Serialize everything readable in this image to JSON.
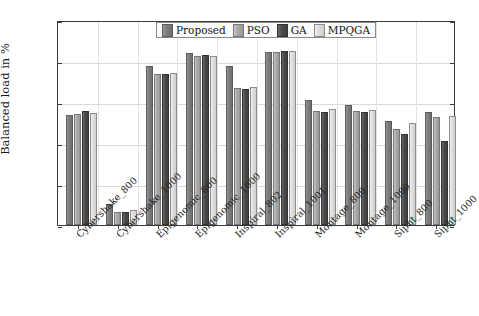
{
  "chart_data": {
    "type": "bar",
    "title": "",
    "xlabel": "",
    "ylabel": "Balanced load in %",
    "ylim": [
      75,
      100
    ],
    "yticks": [
      75,
      80,
      85,
      90,
      95,
      100
    ],
    "grid": true,
    "legend_position": "top-center",
    "categories": [
      "Cybershake_800",
      "Cybershake_1000",
      "Epigenomic_800",
      "Epigenomic_1000",
      "Inspiral_802",
      "Inspiral_1001",
      "Montage_800",
      "Montage_1000",
      "Sipht_800",
      "Sipht_1000"
    ],
    "series": [
      {
        "name": "Proposed",
        "color": "#7e7e7e",
        "values": [
          88.2,
          77.3,
          94.1,
          95.7,
          94.1,
          95.9,
          90.0,
          89.4,
          87.5,
          88.5
        ]
      },
      {
        "name": "PSO",
        "color": "#a8a8a8",
        "values": [
          88.3,
          76.4,
          93.2,
          95.4,
          91.5,
          95.8,
          88.7,
          88.6,
          86.5,
          87.9
        ]
      },
      {
        "name": "GA",
        "color": "#4b4b4b",
        "values": [
          88.6,
          76.3,
          93.2,
          95.5,
          91.3,
          96.0,
          88.5,
          88.5,
          85.8,
          85.0
        ]
      },
      {
        "name": "MPQGA",
        "color": "#dcdcdc",
        "values": [
          88.4,
          76.6,
          93.3,
          95.4,
          91.6,
          96.0,
          88.9,
          88.8,
          87.2,
          88.0
        ]
      }
    ]
  },
  "axis": {
    "y_title": "Balanced load in %",
    "y_tick_labels": [
      "100",
      "95",
      "90",
      "85",
      "80",
      "75"
    ]
  },
  "legend": {
    "items": [
      {
        "label": "Proposed"
      },
      {
        "label": "PSO"
      },
      {
        "label": "GA"
      },
      {
        "label": "MPQGA"
      }
    ]
  }
}
